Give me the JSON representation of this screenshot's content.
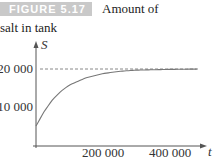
{
  "caption": {
    "figure_label": "FIGURE 5.17",
    "text_line1": "Amount of",
    "text_line2": "salt in tank"
  },
  "chart_data": {
    "type": "line",
    "xlabel": "t",
    "ylabel": "S",
    "xlim": [
      0,
      500000
    ],
    "ylim": [
      0,
      25000
    ],
    "x_ticks": [
      200000,
      400000
    ],
    "x_tick_labels": [
      "200 000",
      "400 000"
    ],
    "y_ticks": [
      10000,
      20000
    ],
    "y_tick_labels": [
      "10 000",
      "20 000"
    ],
    "grid": false,
    "legend": "none",
    "asymptote": {
      "y": 20000,
      "style": "dashed"
    },
    "series": [
      {
        "name": "S(t)",
        "x": [
          0,
          25000,
          50000,
          75000,
          100000,
          150000,
          200000,
          250000,
          300000,
          350000,
          400000,
          450000,
          480000
        ],
        "values": [
          5000,
          8900,
          12000,
          14200,
          15800,
          17700,
          18800,
          19400,
          19700,
          19800,
          19900,
          19950,
          19970
        ]
      }
    ],
    "colors": {
      "curve": "#777777",
      "asymptote": "#888888",
      "axis": "#555555"
    }
  }
}
